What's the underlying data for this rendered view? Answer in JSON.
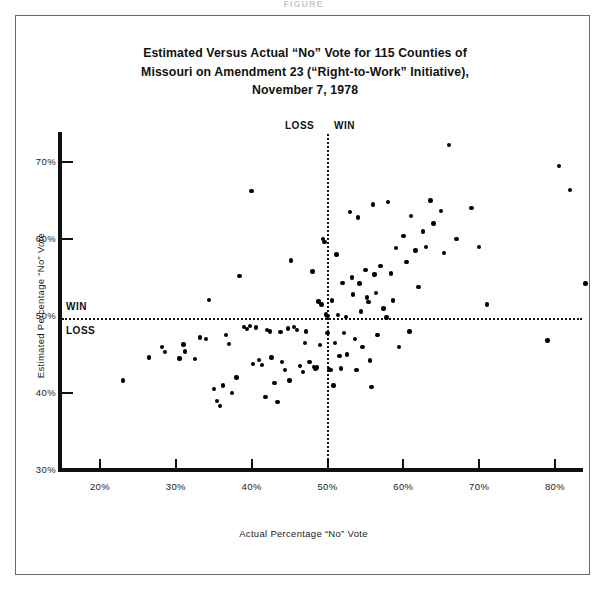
{
  "figure": {
    "cut_header": "FIGURE",
    "title_lines": [
      "Estimated Versus Actual “No” Vote for 115 Counties of",
      "Missouri on Amendment 23 (“Right-to-Work” Initiative),",
      "November 7,  1978"
    ]
  },
  "chart_data": {
    "type": "scatter",
    "title": "Estimated Versus Actual “No” Vote for 115 Counties of Missouri on Amendment 23 (“Right-to-Work” Initiative), November 7,  1978",
    "xlabel": "Actual Percentage “No” Vote",
    "ylabel": "Estimated Percentage “No” Vote",
    "xlim": [
      15,
      85
    ],
    "ylim": [
      30,
      74
    ],
    "xticks": [
      20,
      30,
      40,
      50,
      60,
      70,
      80
    ],
    "xticklabels": [
      "20%",
      "30%",
      "40%",
      "50%",
      "60%",
      "70%",
      "80%"
    ],
    "yticks": [
      30,
      40,
      50,
      60,
      70
    ],
    "yticklabels": [
      "30%",
      "40%",
      "50%",
      "60%",
      "70%"
    ],
    "grid": false,
    "legend": null,
    "reference_lines": [
      {
        "orientation": "vertical",
        "value": 50,
        "style": "dotted",
        "labels": [
          {
            "text": "LOSS",
            "side": "left"
          },
          {
            "text": "WIN",
            "side": "right"
          }
        ]
      },
      {
        "orientation": "horizontal",
        "value": 50,
        "style": "dotted",
        "labels": [
          {
            "text": "WIN",
            "side": "above"
          },
          {
            "text": "LOSS",
            "side": "below"
          }
        ]
      }
    ],
    "marker": {
      "shape": "circle",
      "color": "#000000",
      "size": 4.4
    },
    "n_points": 115,
    "point_color": "#000000",
    "points": [
      [
        23.0,
        41.6
      ],
      [
        26.5,
        44.6
      ],
      [
        28.2,
        46.0
      ],
      [
        28.6,
        45.3
      ],
      [
        30.5,
        44.5
      ],
      [
        31.0,
        46.3
      ],
      [
        31.2,
        45.4
      ],
      [
        32.5,
        44.4
      ],
      [
        33.2,
        47.2
      ],
      [
        34.0,
        47.0
      ],
      [
        34.4,
        52.1
      ],
      [
        35.0,
        40.5
      ],
      [
        35.4,
        39.0
      ],
      [
        35.8,
        38.3
      ],
      [
        36.2,
        41.0
      ],
      [
        36.6,
        47.5
      ],
      [
        37.0,
        46.4
      ],
      [
        37.4,
        40.0
      ],
      [
        38.0,
        42.0
      ],
      [
        38.4,
        55.2
      ],
      [
        39.0,
        48.6
      ],
      [
        39.4,
        48.3
      ],
      [
        39.8,
        48.7
      ],
      [
        40.0,
        66.2
      ],
      [
        40.2,
        43.8
      ],
      [
        40.6,
        48.5
      ],
      [
        41.0,
        44.3
      ],
      [
        41.4,
        43.6
      ],
      [
        41.8,
        39.5
      ],
      [
        42.0,
        48.2
      ],
      [
        42.4,
        48.0
      ],
      [
        42.6,
        44.6
      ],
      [
        43.0,
        41.3
      ],
      [
        43.4,
        38.8
      ],
      [
        43.8,
        47.9
      ],
      [
        44.0,
        44.0
      ],
      [
        44.4,
        43.0
      ],
      [
        44.8,
        48.4
      ],
      [
        45.0,
        41.6
      ],
      [
        45.2,
        57.2
      ],
      [
        45.6,
        48.6
      ],
      [
        46.0,
        48.2
      ],
      [
        46.4,
        43.5
      ],
      [
        46.8,
        42.7
      ],
      [
        47.0,
        46.5
      ],
      [
        47.2,
        48.0
      ],
      [
        47.6,
        44.0
      ],
      [
        48.0,
        55.8
      ],
      [
        48.2,
        43.4
      ],
      [
        48.4,
        43.2
      ],
      [
        48.6,
        43.3
      ],
      [
        48.8,
        51.9
      ],
      [
        49.0,
        46.2
      ],
      [
        49.2,
        51.5
      ],
      [
        49.4,
        60.0
      ],
      [
        49.6,
        59.6
      ],
      [
        49.8,
        50.2
      ],
      [
        50.0,
        50.0
      ],
      [
        50.0,
        47.8
      ],
      [
        50.2,
        43.1
      ],
      [
        50.4,
        43.0
      ],
      [
        50.6,
        52.0
      ],
      [
        50.8,
        41.0
      ],
      [
        51.0,
        46.5
      ],
      [
        51.2,
        58.0
      ],
      [
        51.4,
        50.1
      ],
      [
        51.6,
        44.8
      ],
      [
        51.8,
        43.2
      ],
      [
        52.0,
        54.3
      ],
      [
        52.2,
        47.8
      ],
      [
        52.4,
        49.9
      ],
      [
        52.6,
        45.0
      ],
      [
        53.0,
        63.5
      ],
      [
        53.2,
        55.0
      ],
      [
        53.4,
        52.8
      ],
      [
        53.6,
        47.0
      ],
      [
        53.8,
        43.0
      ],
      [
        54.0,
        62.8
      ],
      [
        54.2,
        54.2
      ],
      [
        54.4,
        50.6
      ],
      [
        54.6,
        46.0
      ],
      [
        55.0,
        56.0
      ],
      [
        55.2,
        52.4
      ],
      [
        55.4,
        51.8
      ],
      [
        55.6,
        44.2
      ],
      [
        55.8,
        40.8
      ],
      [
        56.0,
        64.5
      ],
      [
        56.2,
        55.4
      ],
      [
        56.4,
        53.0
      ],
      [
        56.6,
        47.5
      ],
      [
        57.0,
        56.5
      ],
      [
        57.4,
        51.0
      ],
      [
        57.8,
        49.8
      ],
      [
        58.0,
        64.8
      ],
      [
        58.4,
        55.5
      ],
      [
        58.6,
        52.0
      ],
      [
        59.0,
        58.8
      ],
      [
        59.4,
        46.0
      ],
      [
        60.0,
        60.4
      ],
      [
        60.4,
        57.0
      ],
      [
        60.8,
        48.0
      ],
      [
        61.0,
        63.0
      ],
      [
        61.6,
        58.5
      ],
      [
        62.0,
        53.8
      ],
      [
        62.6,
        61.0
      ],
      [
        63.0,
        59.0
      ],
      [
        63.6,
        65.0
      ],
      [
        64.0,
        62.0
      ],
      [
        65.0,
        63.6
      ],
      [
        65.4,
        58.2
      ],
      [
        66.0,
        72.2
      ],
      [
        67.0,
        60.0
      ],
      [
        69.0,
        64.0
      ],
      [
        70.0,
        59.0
      ],
      [
        71.0,
        51.5
      ],
      [
        79.0,
        46.8
      ],
      [
        80.5,
        69.5
      ],
      [
        82.0,
        66.4
      ],
      [
        84.0,
        54.2
      ]
    ]
  }
}
